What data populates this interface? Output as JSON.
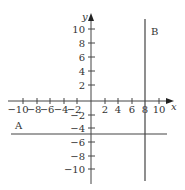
{
  "diagram": {
    "type": "coordinate-plane",
    "axes": {
      "x_label": "x",
      "y_label": "y",
      "x_ticks": [
        -10,
        -8,
        -6,
        -4,
        -2,
        2,
        4,
        6,
        8,
        10
      ],
      "y_ticks": [
        10,
        8,
        6,
        4,
        2,
        -2,
        -4,
        -6,
        -8,
        -10
      ],
      "x_tick_labels": [
        "−10",
        "−8",
        "−6",
        "−4",
        "−2",
        "2",
        "4",
        "6",
        "8",
        "10"
      ],
      "y_tick_labels": [
        "10",
        "8",
        "6",
        "4",
        "2",
        "−2",
        "−4",
        "−6",
        "−8",
        "−10"
      ]
    },
    "lines": [
      {
        "label": "A",
        "orientation": "horizontal",
        "equation": "y = -5"
      },
      {
        "label": "B",
        "orientation": "vertical",
        "equation": "x = 8"
      }
    ],
    "line_color": "#444444"
  }
}
